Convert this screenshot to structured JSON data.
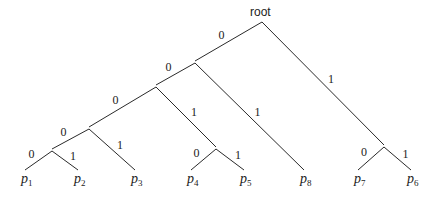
{
  "diagram": {
    "type": "binary-code-tree",
    "root_label": "root",
    "nodes": [
      {
        "id": "root",
        "x": 262,
        "y": 22
      },
      {
        "id": "n0",
        "x": 195,
        "y": 63
      },
      {
        "id": "n00",
        "x": 156,
        "y": 87
      },
      {
        "id": "n000",
        "x": 89,
        "y": 129
      },
      {
        "id": "n0000",
        "x": 52,
        "y": 151
      },
      {
        "id": "n001",
        "x": 216,
        "y": 149
      },
      {
        "id": "n1",
        "x": 384,
        "y": 147
      }
    ],
    "leaves": [
      {
        "id": "p1",
        "base": "p",
        "sub": "1",
        "x": 25,
        "y": 172
      },
      {
        "id": "p2",
        "base": "p",
        "sub": "2",
        "x": 78,
        "y": 172
      },
      {
        "id": "p3",
        "base": "p",
        "sub": "3",
        "x": 135,
        "y": 172
      },
      {
        "id": "p4",
        "base": "p",
        "sub": "4",
        "x": 191,
        "y": 172
      },
      {
        "id": "p5",
        "base": "p",
        "sub": "5",
        "x": 244,
        "y": 172
      },
      {
        "id": "p8",
        "base": "p",
        "sub": "8",
        "x": 304,
        "y": 172
      },
      {
        "id": "p7",
        "base": "p",
        "sub": "7",
        "x": 358,
        "y": 172
      },
      {
        "id": "p6",
        "base": "p",
        "sub": "6",
        "x": 411,
        "y": 172
      }
    ],
    "edges": [
      {
        "from": "root",
        "to": "n0",
        "label": "0"
      },
      {
        "from": "root",
        "to": "n1",
        "label": "1"
      },
      {
        "from": "n0",
        "to": "n00",
        "label": "0"
      },
      {
        "from": "n0",
        "to": "p8",
        "label": "1"
      },
      {
        "from": "n00",
        "to": "n000",
        "label": "0"
      },
      {
        "from": "n00",
        "to": "n001",
        "label": "1"
      },
      {
        "from": "n000",
        "to": "n0000",
        "label": "0"
      },
      {
        "from": "n000",
        "to": "p3",
        "label": "1"
      },
      {
        "from": "n0000",
        "to": "p1",
        "label": "0"
      },
      {
        "from": "n0000",
        "to": "p2",
        "label": "1"
      },
      {
        "from": "n001",
        "to": "p4",
        "label": "0"
      },
      {
        "from": "n001",
        "to": "p5",
        "label": "1"
      },
      {
        "from": "n1",
        "to": "p7",
        "label": "0"
      },
      {
        "from": "n1",
        "to": "p6",
        "label": "1"
      }
    ],
    "edge_labels": [
      {
        "text": "0",
        "x": 171,
        "y": 72
      },
      {
        "text": "1",
        "x": 335,
        "y": 81
      },
      {
        "text": "0",
        "x": 116,
        "y": 102
      },
      {
        "text": "1",
        "x": 261,
        "y": 114
      },
      {
        "text": "0",
        "x": 64,
        "y": 135
      },
      {
        "text": "1",
        "x": 189,
        "y": 117
      },
      {
        "text": "0",
        "x": 30,
        "y": 162
      },
      {
        "text": "1",
        "x": 117,
        "y": 152
      },
      {
        "text": "0",
        "x": 30,
        "y": 162
      },
      {
        "text": "1",
        "x": 68,
        "y": 162
      },
      {
        "text": "0",
        "x": 195,
        "y": 161
      },
      {
        "text": "1",
        "x": 238,
        "y": 161
      },
      {
        "text": "0",
        "x": 364,
        "y": 161
      },
      {
        "text": "1",
        "x": 402,
        "y": 160
      }
    ]
  }
}
